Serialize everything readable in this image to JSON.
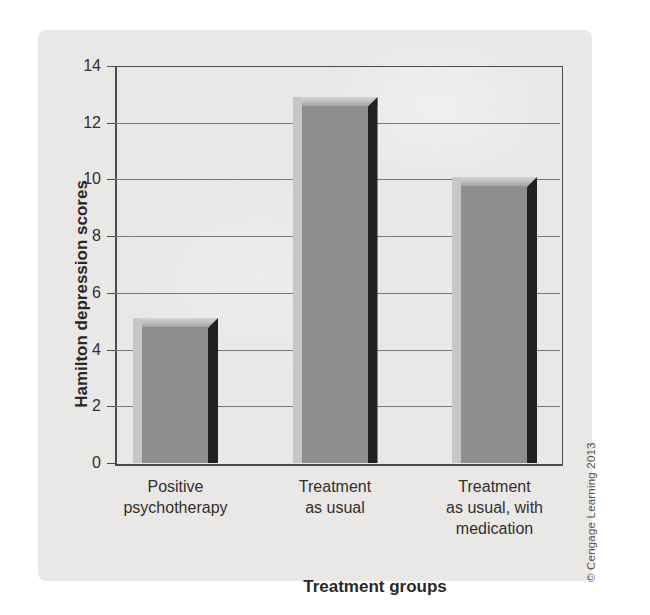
{
  "figure": {
    "credit": "© Cengage Learning 2013"
  },
  "chart_data": {
    "type": "bar",
    "title": "",
    "xlabel": "Treatment groups",
    "ylabel": "Hamilton depression scores",
    "categories": [
      "Positive psychotherapy",
      "Treatment as usual",
      "Treatment as usual, with medication"
    ],
    "category_lines": [
      [
        "Positive",
        "psychotherapy"
      ],
      [
        "Treatment",
        "as usual"
      ],
      [
        "Treatment",
        "as usual, with",
        "medication"
      ]
    ],
    "values": [
      5.1,
      12.9,
      10.1
    ],
    "ylim": [
      0,
      14
    ],
    "yticks": [
      0,
      2,
      4,
      6,
      8,
      10,
      12,
      14
    ],
    "grid": true,
    "legend": "none",
    "style": "3d-bevel-bars",
    "colors": {
      "panel_bg": "#e9e8e6",
      "bar_face": "#8e8e8c",
      "bar_left_highlight": "#c6c6c4",
      "bar_top_bevel": "#b8b8b6",
      "bar_right_shadow": "#21211f",
      "axis": "#4c4a48",
      "gridline": "#7b7976",
      "text": "#332f2c"
    }
  }
}
